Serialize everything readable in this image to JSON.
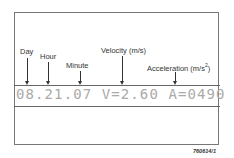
{
  "diagram": {
    "labels": {
      "day": "Day",
      "hour": "Hour",
      "minute": "Minute",
      "velocity": "Velocity (m/s)",
      "acceleration": "Acceleration (m/s",
      "acceleration_sup": "2",
      "acceleration_close": ")"
    },
    "readout": "08.21.07 V=2.60 A=0490",
    "figure_ref": "760614/1",
    "colors": {
      "line": "#333333",
      "readout": "#aaaaaa",
      "frame": "#777777"
    }
  }
}
